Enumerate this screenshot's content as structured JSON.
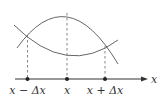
{
  "diagram": {
    "axis": {
      "label": "x"
    },
    "points": [
      {
        "label": "x − Δx",
        "x": 28
      },
      {
        "label": "x",
        "x": 67
      },
      {
        "label": "x + Δx",
        "x": 105
      }
    ],
    "curves": [
      {
        "name": "concave-down",
        "description": "downward-opening parabola with peak above x"
      },
      {
        "name": "concave-up",
        "description": "upward-opening curve with minimum above x"
      }
    ],
    "colors": {
      "stroke": "#555555",
      "axis": "#333333"
    }
  }
}
